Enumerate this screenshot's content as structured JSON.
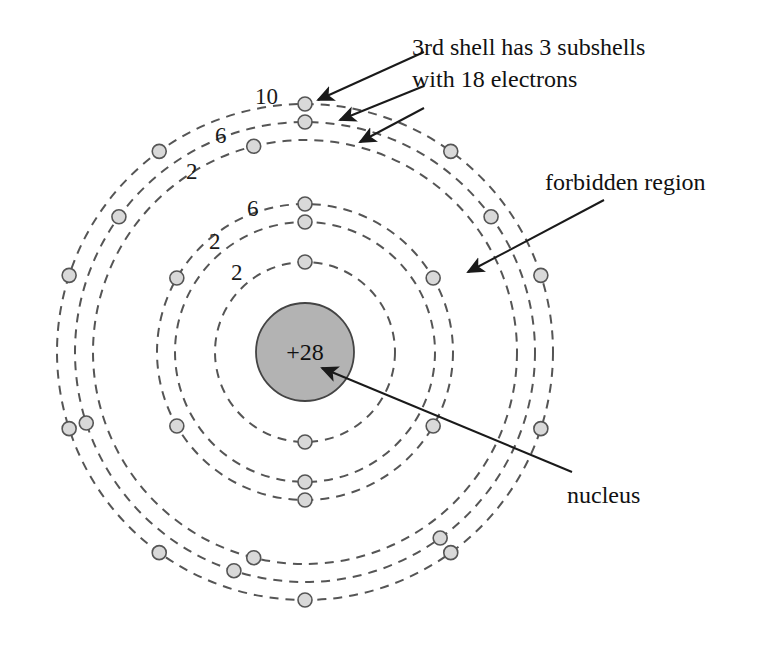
{
  "figure": {
    "background_color": "#ffffff",
    "width": 759,
    "height": 646
  },
  "nucleus": {
    "label": "+28",
    "charge": 28,
    "fill_color": "#b3b3b3",
    "stroke_color": "#444444",
    "center_x": 305,
    "center_y": 352,
    "radius": 49
  },
  "annotations": {
    "shell3_note_line1": "3rd shell has 3 subshells",
    "shell3_note_line2": "with 18 electrons",
    "forbidden_region": "forbidden region",
    "nucleus": "nucleus"
  },
  "subshell_labels": [
    {
      "text": "2",
      "x": 231,
      "y": 280,
      "shell": 1,
      "subshell": "1s"
    },
    {
      "text": "2",
      "x": 209,
      "y": 249,
      "shell": 2,
      "subshell": "2s"
    },
    {
      "text": "6",
      "x": 247,
      "y": 216,
      "shell": 2,
      "subshell": "2p"
    },
    {
      "text": "2",
      "x": 186,
      "y": 179,
      "shell": 3,
      "subshell": "3s"
    },
    {
      "text": "6",
      "x": 215,
      "y": 143,
      "shell": 3,
      "subshell": "3p"
    },
    {
      "text": "10",
      "x": 255,
      "y": 104,
      "shell": 3,
      "subshell": "3d"
    }
  ],
  "shells": [
    {
      "name": "1st shell",
      "electron_capacity": 2,
      "orbits": [
        {
          "subshell": "1s",
          "radius": 90,
          "electron_count": 2,
          "electron_angles_deg": [
            90,
            270
          ]
        }
      ]
    },
    {
      "name": "2nd shell",
      "electron_capacity": 8,
      "orbits": [
        {
          "subshell": "2s",
          "radius": 130,
          "electron_count": 2,
          "electron_angles_deg": [
            90,
            270
          ]
        },
        {
          "subshell": "2p",
          "radius": 148,
          "electron_count": 6,
          "electron_angles_deg": [
            90,
            150,
            210,
            270,
            330,
            30
          ]
        }
      ]
    },
    {
      "name": "3rd shell",
      "electron_capacity": 18,
      "orbits": [
        {
          "subshell": "3s",
          "radius": 212,
          "electron_count": 2,
          "electron_angles_deg": [
            104,
            256
          ]
        },
        {
          "subshell": "3p",
          "radius": 230,
          "electron_count": 6,
          "electron_angles_deg": [
            90,
            144,
            198,
            252,
            306,
            36
          ]
        },
        {
          "subshell": "3d",
          "radius": 248,
          "electron_count": 10,
          "electron_angles_deg": [
            90,
            126,
            162,
            198,
            234,
            270,
            306,
            342,
            18,
            54
          ]
        }
      ]
    }
  ],
  "electron_style": {
    "fill_color": "#d9d9d9",
    "stroke_color": "#555555",
    "radius": 7
  },
  "orbit_style": {
    "stroke_color": "#555555",
    "dash_pattern": "9 7",
    "stroke_width": 2
  },
  "arrows": [
    {
      "name": "arrow-to-3d",
      "x1": 424,
      "y1": 52,
      "x2": 318,
      "y2": 100
    },
    {
      "name": "arrow-to-3p",
      "x1": 424,
      "y1": 86,
      "x2": 340,
      "y2": 120
    },
    {
      "name": "arrow-to-3s",
      "x1": 424,
      "y1": 108,
      "x2": 360,
      "y2": 142
    },
    {
      "name": "arrow-to-forbidden-region",
      "x1": 604,
      "y1": 200,
      "x2": 468,
      "y2": 272
    },
    {
      "name": "arrow-to-nucleus",
      "x1": 572,
      "y1": 472,
      "x2": 322,
      "y2": 368
    }
  ],
  "arrow_style": {
    "stroke_color": "#1a1a1a",
    "stroke_width": 2
  },
  "text_positions": {
    "shell3_note_line1": {
      "x": 412,
      "y": 55
    },
    "shell3_note_line2": {
      "x": 412,
      "y": 87
    },
    "forbidden_region": {
      "x": 545,
      "y": 190
    },
    "nucleus": {
      "x": 567,
      "y": 503
    }
  }
}
